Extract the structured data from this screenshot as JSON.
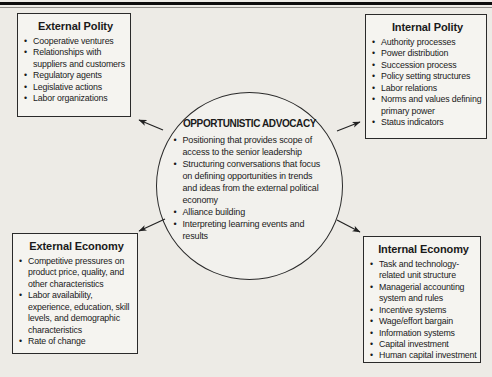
{
  "chars": {
    "bullet": "•"
  },
  "colors": {
    "page_bg": "#edebe6",
    "panel_bg": "#f5f4f0",
    "border": "#2a2a2a",
    "text": "#1a1a1a",
    "top_rule": "#0c0c0c"
  },
  "center": {
    "title": "OPPORTUNISTIC ADVOCACY",
    "bullets": [
      "Positioning that provides scope of access to the senior leadership",
      "Structuring conversations that focus on defining opportunities in trends and ideas from the external political economy",
      "Alliance building",
      "Interpreting learning events and results"
    ]
  },
  "boxes": [
    {
      "title": "External Polity",
      "bullets": [
        "Cooperative ventures",
        "Relationships with suppliers and customers",
        "Regulatory agents",
        "Legislative actions",
        "Labor organizations"
      ]
    },
    {
      "title": "Internal Polity",
      "bullets": [
        "Authority processes",
        "Power distribution",
        "Succession process",
        "Policy setting structures",
        "Labor relations",
        "Norms and values defining primary power",
        "Status indicators"
      ]
    },
    {
      "title": "External Economy",
      "bullets": [
        "Competitive pressures on product price, quality, and other characteristics",
        "Labor availability, experience, education, skill levels, and demographic characteristics",
        "Rate of change"
      ]
    },
    {
      "title": "Internal Economy",
      "bullets": [
        "Task and technology-related unit structure",
        "Managerial accounting system and rules",
        "Incentive systems",
        "Wage/effort bargain",
        "Information systems",
        "Capital investment",
        "Human capital investment"
      ]
    }
  ]
}
